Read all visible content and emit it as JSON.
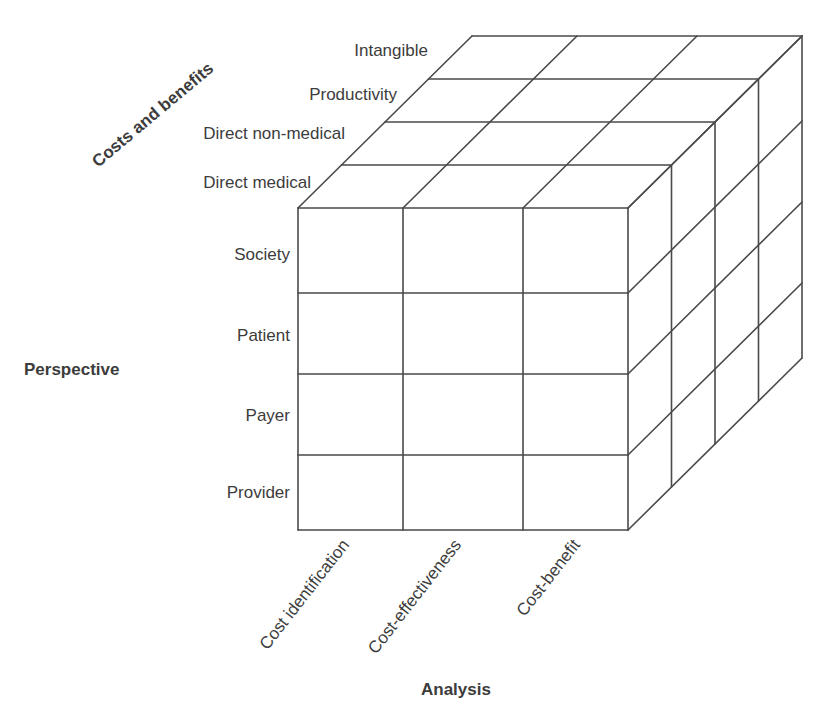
{
  "diagram": {
    "axes": {
      "costs_and_benefits": {
        "title": "Costs and benefits",
        "items": [
          "Direct medical",
          "Direct non-medical",
          "Productivity",
          "Intangible"
        ]
      },
      "perspective": {
        "title": "Perspective",
        "items": [
          "Society",
          "Patient",
          "Payer",
          "Provider"
        ]
      },
      "analysis": {
        "title": "Analysis",
        "items": [
          "Cost identification",
          "Cost-effectiveness",
          "Cost-benefit"
        ]
      }
    },
    "colors": {
      "line": "#4a4a4a",
      "text": "#3c3c3c",
      "background": "#ffffff"
    }
  }
}
